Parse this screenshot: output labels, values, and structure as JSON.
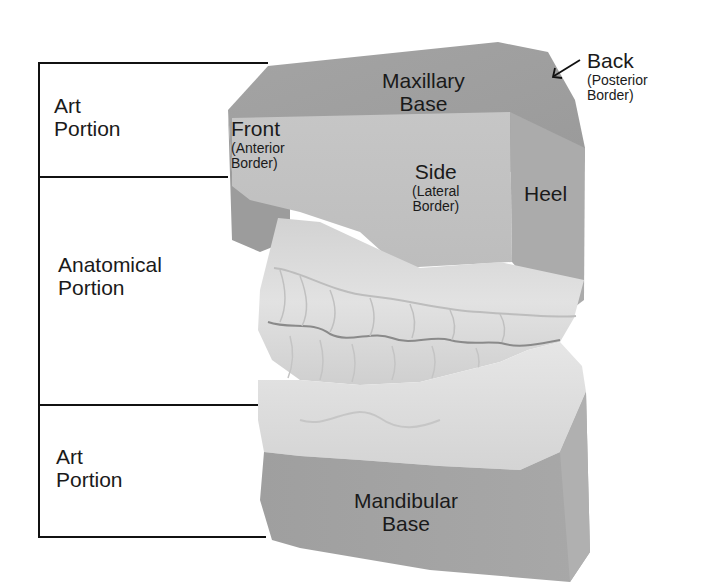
{
  "diagram": {
    "colors": {
      "background": "#ffffff",
      "line": "#111111",
      "text": "#1a1a1a",
      "base_face_dark": "#9a9a9a",
      "base_face_mid": "#acacac",
      "side_face": "#c2c2c2",
      "teeth_light": "#dcdcdc"
    },
    "left_brackets": [
      {
        "id": "upper-art",
        "line1": "Art",
        "line2": "Portion"
      },
      {
        "id": "anatomical",
        "line1": "Anatomical",
        "line2": "Portion"
      },
      {
        "id": "lower-art",
        "line1": "Art",
        "line2": "Portion"
      }
    ],
    "cast_labels": {
      "maxillary_base": {
        "line1": "Maxillary",
        "line2": "Base"
      },
      "front": {
        "title": "Front",
        "sub1": "(Anterior",
        "sub2": "Border)"
      },
      "side": {
        "title": "Side",
        "sub1": "(Lateral",
        "sub2": "Border)"
      },
      "heel": {
        "title": "Heel"
      },
      "back": {
        "title": "Back",
        "sub1": "(Posterior",
        "sub2": "Border)"
      },
      "mandibular_base": {
        "line1": "Mandibular",
        "line2": "Base"
      }
    },
    "pointer": {
      "icon": "arrow-icon",
      "direction": "down-left"
    }
  }
}
